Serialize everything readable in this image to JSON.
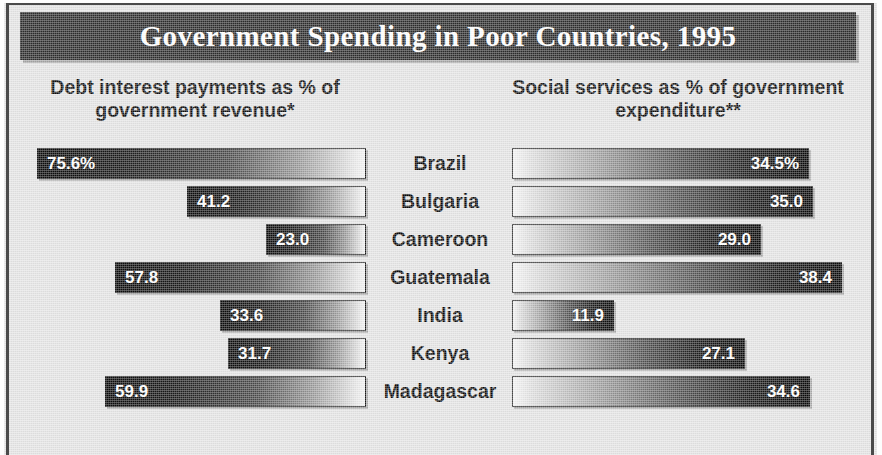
{
  "title": "Government Spending in Poor Countries, 1995",
  "headers": {
    "left": "Debt interest payments as % of government revenue*",
    "right": "Social services as % of government expenditure**"
  },
  "colors": {
    "banner_background": "#2c2c2c",
    "banner_text": "#ffffff",
    "panel_background": "#e4e4e4",
    "bar_dark": "#090909",
    "bar_light": "#f5f5f5",
    "label_text": "#090909",
    "value_text": "#ffffff",
    "frame_rule": "#4a4a4a"
  },
  "chart_data": {
    "type": "bar",
    "title": "Government Spending in Poor Countries, 1995",
    "xlabel": "",
    "ylabel": "",
    "orientation": "horizontal",
    "layout": "bidirectional-paired-bars",
    "grid": false,
    "legend_position": "none",
    "categories": [
      "Brazil",
      "Bulgaria",
      "Cameroon",
      "Guatemala",
      "India",
      "Kenya",
      "Madagascar"
    ],
    "series": [
      {
        "name": "Debt interest payments as % of government revenue*",
        "side": "left",
        "unit": "%",
        "axis_max": 80.0,
        "values": [
          75.6,
          41.2,
          23.0,
          57.8,
          33.6,
          31.7,
          59.9
        ]
      },
      {
        "name": "Social services as % of government expenditure**",
        "side": "right",
        "unit": "%",
        "axis_max": 40.0,
        "values": [
          34.5,
          35.0,
          29.0,
          38.4,
          11.9,
          27.1,
          34.6
        ]
      }
    ],
    "annotations": [
      "* asterisk footnote marker on left column header",
      "** double asterisk footnote marker on right column header"
    ]
  },
  "rows": [
    {
      "country": "Brazil",
      "left_value": "75.6%",
      "left_num": 75.6,
      "right_value": "34.5%",
      "right_num": 34.5
    },
    {
      "country": "Bulgaria",
      "left_value": "41.2",
      "left_num": 41.2,
      "right_value": "35.0",
      "right_num": 35.0
    },
    {
      "country": "Cameroon",
      "left_value": "23.0",
      "left_num": 23.0,
      "right_value": "29.0",
      "right_num": 29.0
    },
    {
      "country": "Guatemala",
      "left_value": "57.8",
      "left_num": 57.8,
      "right_value": "38.4",
      "right_num": 38.4
    },
    {
      "country": "India",
      "left_value": "33.6",
      "left_num": 33.6,
      "right_value": "11.9",
      "right_num": 11.9
    },
    {
      "country": "Kenya",
      "left_value": "31.7",
      "left_num": 31.7,
      "right_value": "27.1",
      "right_num": 27.1
    },
    {
      "country": "Madagascar",
      "left_value": "59.9",
      "left_num": 59.9,
      "right_value": "34.6",
      "right_num": 34.6
    }
  ],
  "geometry": {
    "first_row_top": 148,
    "row_pitch": 38,
    "left_track_width": 348,
    "right_track_width": 344,
    "left_scale_max": 80.0,
    "right_scale_max": 40.0
  }
}
